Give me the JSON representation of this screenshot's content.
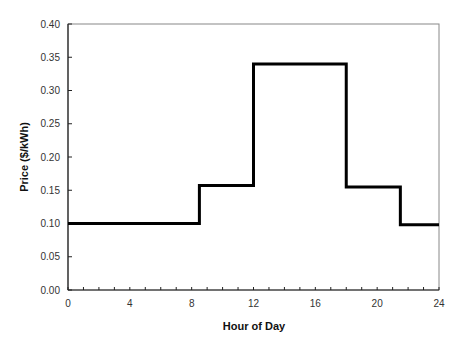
{
  "chart_data": {
    "type": "line",
    "subtype": "step",
    "title": "",
    "xlabel": "Hour of Day",
    "ylabel": "Price ($/kWh)",
    "xlim": [
      0,
      24
    ],
    "ylim": [
      0,
      0.4
    ],
    "x_ticks": [
      0,
      4,
      8,
      12,
      16,
      20,
      24
    ],
    "x_minor_step": 1,
    "y_ticks": [
      "0.00",
      "0.05",
      "0.10",
      "0.15",
      "0.20",
      "0.25",
      "0.30",
      "0.35",
      "0.40"
    ],
    "grid": false,
    "legend": null,
    "series": [
      {
        "name": "Price",
        "color": "#000000",
        "steps": [
          {
            "from": 0,
            "to": 8.5,
            "value": 0.1
          },
          {
            "from": 8.5,
            "to": 12,
            "value": 0.157
          },
          {
            "from": 12,
            "to": 18,
            "value": 0.34
          },
          {
            "from": 18,
            "to": 21.5,
            "value": 0.155
          },
          {
            "from": 21.5,
            "to": 24,
            "value": 0.098
          }
        ]
      }
    ]
  }
}
